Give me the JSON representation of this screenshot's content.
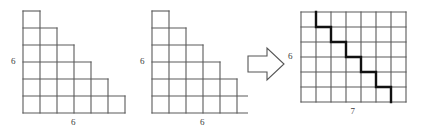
{
  "figure": {
    "background_color": "#ffffff",
    "grid_line_color": "#5a5a5a",
    "bold_path_color": "#111111",
    "label_color": "#3b3b3b",
    "arrow_outline_color": "#555555"
  },
  "panels": [
    {
      "id": "staircase-left",
      "kind": "staircase",
      "cell_size": 17,
      "origin": {
        "x": 23,
        "y": 11
      },
      "rows": [
        1,
        2,
        3,
        4,
        5,
        6
      ],
      "labels": {
        "left": "6",
        "bottom": "6"
      }
    },
    {
      "id": "staircase-middle",
      "kind": "staircase",
      "cell_size": 17,
      "origin": {
        "x": 22,
        "y": 11
      },
      "rows": [
        1,
        2,
        3,
        4,
        5,
        6
      ],
      "labels": {
        "left": "6",
        "bottom": "6"
      }
    },
    {
      "id": "transform-arrow",
      "kind": "arrow",
      "direction": "right",
      "icon": "block-arrow-right-icon"
    },
    {
      "id": "lattice-grid-right",
      "kind": "grid-with-path",
      "cell_size": 15,
      "origin": {
        "x": 19,
        "y": 12
      },
      "columns": 7,
      "grid_rows": 6,
      "labels": {
        "left": "6",
        "bottom": "7"
      },
      "path": {
        "name": "bold-staircase-path",
        "start": {
          "col": 1,
          "row": 0
        },
        "points": [
          {
            "col": 1,
            "row": 0
          },
          {
            "col": 1,
            "row": 1
          },
          {
            "col": 2,
            "row": 1
          },
          {
            "col": 2,
            "row": 2
          },
          {
            "col": 3,
            "row": 2
          },
          {
            "col": 3,
            "row": 3
          },
          {
            "col": 4,
            "row": 3
          },
          {
            "col": 4,
            "row": 4
          },
          {
            "col": 5,
            "row": 4
          },
          {
            "col": 5,
            "row": 5
          },
          {
            "col": 6,
            "row": 5
          },
          {
            "col": 6,
            "row": 6
          }
        ],
        "stroke_width": 2.4
      }
    }
  ]
}
